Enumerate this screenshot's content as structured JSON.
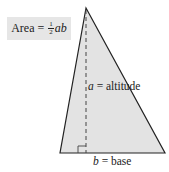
{
  "formula": {
    "prefix": "Area = ",
    "fraction_numerator": "1",
    "fraction_denominator": "2",
    "variables": "ab"
  },
  "labels": {
    "altitude_var": "a",
    "altitude_text": " = altitude",
    "base_var": "b",
    "base_text": " = base"
  },
  "colors": {
    "triangle_fill": "#e3e3e3",
    "outline": "#222222",
    "formula_bg": "#e6e6e6"
  }
}
